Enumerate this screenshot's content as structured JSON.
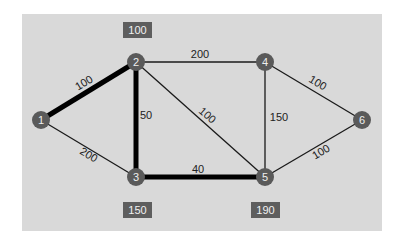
{
  "diagram": {
    "type": "weighted-graph",
    "colors": {
      "panel": "#d9d9d9",
      "node_fill": "#5a5a5a",
      "node_text": "#efefef",
      "edge": "#1a1a1a",
      "highlight_edge": "#000000",
      "label_box": "#5e5e5e",
      "label_box_text": "#f2f2f2"
    },
    "nodes": [
      {
        "id": "1",
        "label": "1",
        "x": 41,
        "y": 120
      },
      {
        "id": "2",
        "label": "2",
        "x": 136,
        "y": 62
      },
      {
        "id": "3",
        "label": "3",
        "x": 136,
        "y": 177
      },
      {
        "id": "4",
        "label": "4",
        "x": 265,
        "y": 62
      },
      {
        "id": "5",
        "label": "5",
        "x": 265,
        "y": 177
      },
      {
        "id": "6",
        "label": "6",
        "x": 362,
        "y": 120
      }
    ],
    "edges": [
      {
        "from": "1",
        "to": "2",
        "weight": "100",
        "highlighted": true
      },
      {
        "from": "1",
        "to": "3",
        "weight": "200",
        "highlighted": false
      },
      {
        "from": "2",
        "to": "3",
        "weight": "50",
        "highlighted": true
      },
      {
        "from": "2",
        "to": "4",
        "weight": "200",
        "highlighted": false
      },
      {
        "from": "2",
        "to": "5",
        "weight": "100",
        "highlighted": false
      },
      {
        "from": "3",
        "to": "5",
        "weight": "40",
        "highlighted": true
      },
      {
        "from": "4",
        "to": "5",
        "weight": "150",
        "highlighted": false
      },
      {
        "from": "4",
        "to": "6",
        "weight": "100",
        "highlighted": false
      },
      {
        "from": "5",
        "to": "6",
        "weight": "100",
        "highlighted": false
      }
    ],
    "distance_labels": [
      {
        "node": "2",
        "value": "100"
      },
      {
        "node": "3",
        "value": "150"
      },
      {
        "node": "5",
        "value": "190"
      }
    ]
  }
}
